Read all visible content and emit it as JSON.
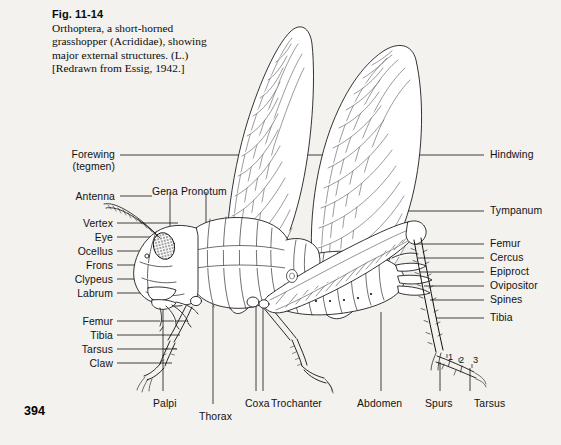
{
  "page": {
    "number": "394",
    "background": "#f3f2ee",
    "ink": "#111111"
  },
  "caption": {
    "figure_number": "Fig. 11-14",
    "line1": "Orthoptera, a short-horned",
    "line2": "grasshopper (Acrididae), showing",
    "line3": "major external structures. (L.)",
    "line4": "[Redrawn from Essig, 1942.]"
  },
  "labels_left": [
    {
      "name": "forewing",
      "text": "Forewing",
      "text2": "(tegmen)",
      "x": 115,
      "y": 149,
      "leader_x1": 120,
      "leader_x2": 403,
      "leader_y": 155
    },
    {
      "name": "antenna",
      "text": "Antenna",
      "x": 115,
      "y": 191,
      "leader_x1": 120,
      "leader_x2": 152,
      "leader_y": 196
    },
    {
      "name": "vertex",
      "text": "Vertex",
      "x": 113,
      "y": 218,
      "leader_x1": 117,
      "leader_x2": 178,
      "leader_y": 223
    },
    {
      "name": "eye",
      "text": "Eye",
      "x": 113,
      "y": 232,
      "leader_x1": 117,
      "leader_x2": 169,
      "leader_y": 237
    },
    {
      "name": "ocellus",
      "text": "Ocellus",
      "x": 113,
      "y": 246,
      "leader_x1": 117,
      "leader_x2": 163,
      "leader_y": 251
    },
    {
      "name": "frons",
      "text": "Frons",
      "x": 113,
      "y": 260,
      "leader_x1": 117,
      "leader_x2": 160,
      "leader_y": 265
    },
    {
      "name": "clypeus",
      "text": "Clypeus",
      "x": 113,
      "y": 274,
      "leader_x1": 117,
      "leader_x2": 164,
      "leader_y": 279
    },
    {
      "name": "labrum",
      "text": "Labrum",
      "x": 113,
      "y": 288,
      "leader_x1": 117,
      "leader_x2": 170,
      "leader_y": 293
    },
    {
      "name": "femur-fore",
      "text": "Femur",
      "x": 113,
      "y": 316,
      "leader_x1": 117,
      "leader_x2": 188,
      "leader_y": 321
    },
    {
      "name": "tibia-fore",
      "text": "Tibia",
      "x": 113,
      "y": 330,
      "leader_x1": 117,
      "leader_x2": 180,
      "leader_y": 335
    },
    {
      "name": "tarsus-fore",
      "text": "Tarsus",
      "x": 113,
      "y": 344,
      "leader_x1": 117,
      "leader_x2": 177,
      "leader_y": 349
    },
    {
      "name": "claw",
      "text": "Claw",
      "x": 113,
      "y": 358,
      "leader_x1": 117,
      "leader_x2": 172,
      "leader_y": 363
    }
  ],
  "labels_right": [
    {
      "name": "hindwing",
      "text": "Hindwing",
      "x": 490,
      "y": 149,
      "leader_x1": 408,
      "leader_x2": 484,
      "leader_y": 155
    },
    {
      "name": "tympanum",
      "text": "Tympanum",
      "x": 490,
      "y": 205,
      "leader_x1": 400,
      "leader_x2": 484,
      "leader_y": 211
    },
    {
      "name": "femur-hind",
      "text": "Femur",
      "x": 490,
      "y": 238,
      "leader_x1": 414,
      "leader_x2": 484,
      "leader_y": 244
    },
    {
      "name": "cercus",
      "text": "Cercus",
      "x": 490,
      "y": 252,
      "leader_x1": 418,
      "leader_x2": 484,
      "leader_y": 258
    },
    {
      "name": "epiproct",
      "text": "Epiproct",
      "x": 490,
      "y": 266,
      "leader_x1": 420,
      "leader_x2": 484,
      "leader_y": 272
    },
    {
      "name": "ovipositor",
      "text": "Ovipositor",
      "x": 490,
      "y": 280,
      "leader_x1": 424,
      "leader_x2": 484,
      "leader_y": 286
    },
    {
      "name": "spines",
      "text": "Spines",
      "x": 490,
      "y": 294,
      "leader_x1": 430,
      "leader_x2": 484,
      "leader_y": 300
    },
    {
      "name": "tibia-hind",
      "text": "Tibia",
      "x": 490,
      "y": 312,
      "leader_x1": 436,
      "leader_x2": 484,
      "leader_y": 318
    }
  ],
  "labels_top": [
    {
      "name": "gena",
      "text": "Gena",
      "x": 152,
      "y": 186,
      "leader_x": 170,
      "leader_y1": 192,
      "leader_y2": 247
    },
    {
      "name": "pronotum",
      "text": "Pronotum",
      "x": 181,
      "y": 186,
      "leader_x": 206,
      "leader_y1": 192,
      "leader_y2": 234
    }
  ],
  "labels_bottom": [
    {
      "name": "palpi",
      "text": "Palpi",
      "x": 153,
      "y": 398,
      "leader_x": 163,
      "leader_y1": 308,
      "leader_y2": 391
    },
    {
      "name": "thorax",
      "text": "Thorax",
      "x": 199,
      "y": 411,
      "leader_x": 213,
      "leader_y1": 300,
      "leader_y2": 404
    },
    {
      "name": "coxa",
      "text": "Coxa",
      "x": 245,
      "y": 398,
      "leader_x": 256,
      "leader_y1": 300,
      "leader_y2": 391
    },
    {
      "name": "trochanter",
      "text": "Trochanter",
      "x": 271,
      "y": 398,
      "leader_x": 263,
      "leader_y1": 300,
      "leader_y2": 391
    },
    {
      "name": "abdomen",
      "text": "Abdomen",
      "x": 357,
      "y": 398,
      "leader_x": 381,
      "leader_y1": 312,
      "leader_y2": 391
    },
    {
      "name": "spurs",
      "text": "Spurs",
      "x": 425,
      "y": 398,
      "leader_x": 440,
      "leader_y1": 362,
      "leader_y2": 391
    },
    {
      "name": "tarsus-hind",
      "text": "Tarsus",
      "x": 474,
      "y": 398,
      "leader_x": 470,
      "leader_y1": 368,
      "leader_y2": 391
    }
  ],
  "tarsal_segments": [
    {
      "label": "1",
      "x": 448,
      "y": 352
    },
    {
      "label": "2",
      "x": 459,
      "y": 355
    },
    {
      "label": "3",
      "x": 473,
      "y": 355
    }
  ]
}
